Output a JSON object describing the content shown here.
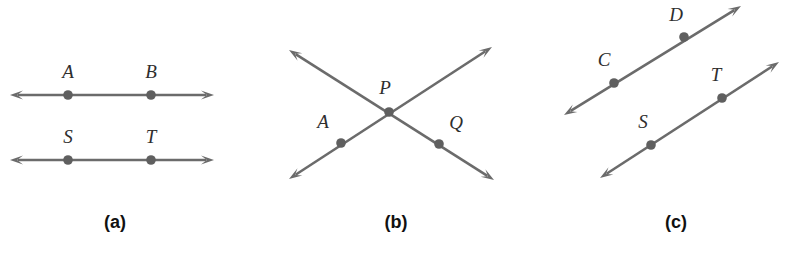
{
  "figure": {
    "width": 793,
    "height": 257,
    "background": "#ffffff",
    "line_color": "#6b6b6b",
    "dot_color": "#5f5f5f",
    "label_color": "#2e2e2e",
    "caption_color": "#111111"
  },
  "panels": [
    {
      "id": "panel-a",
      "caption": "(a)",
      "caption_x": 115,
      "caption_y": 228,
      "kind": "parallel-horizontal-lines",
      "lines": [
        {
          "name": "line-AB",
          "x1": 10,
          "y1": 95,
          "x2": 214,
          "y2": 95,
          "arrow_start": true,
          "arrow_end": true
        },
        {
          "name": "line-ST",
          "x1": 10,
          "y1": 160,
          "x2": 214,
          "y2": 160,
          "arrow_start": true,
          "arrow_end": true
        }
      ],
      "points": [
        {
          "name": "point-A",
          "label": "A",
          "x": 68,
          "y": 95,
          "label_x": 68,
          "label_y": 78
        },
        {
          "name": "point-B",
          "label": "B",
          "x": 151,
          "y": 95,
          "label_x": 151,
          "label_y": 78
        },
        {
          "name": "point-S",
          "label": "S",
          "x": 68,
          "y": 160,
          "label_x": 68,
          "label_y": 143
        },
        {
          "name": "point-T",
          "label": "T",
          "x": 151,
          "y": 160,
          "label_x": 151,
          "label_y": 143
        }
      ]
    },
    {
      "id": "panel-b",
      "caption": "(b)",
      "caption_x": 396,
      "caption_y": 228,
      "kind": "intersecting-lines",
      "lines": [
        {
          "name": "line-through-A",
          "x1": 289,
          "y1": 50,
          "x2": 494,
          "y2": 180,
          "arrow_start": true,
          "arrow_end": true
        },
        {
          "name": "line-through-Q",
          "x1": 289,
          "y1": 179,
          "x2": 492,
          "y2": 47,
          "arrow_start": true,
          "arrow_end": true
        }
      ],
      "points": [
        {
          "name": "point-P",
          "label": "P",
          "x": 389,
          "y": 112,
          "label_x": 385,
          "label_y": 94
        },
        {
          "name": "point-A",
          "label": "A",
          "x": 341,
          "y": 143,
          "label_x": 323,
          "label_y": 128
        },
        {
          "name": "point-Q",
          "label": "Q",
          "x": 439,
          "y": 144,
          "label_x": 456,
          "label_y": 129
        }
      ]
    },
    {
      "id": "panel-c",
      "caption": "(c)",
      "caption_x": 676,
      "caption_y": 228,
      "kind": "parallel-oblique-lines",
      "lines": [
        {
          "name": "line-CD",
          "x1": 564,
          "y1": 115,
          "x2": 741,
          "y2": 6,
          "arrow_start": true,
          "arrow_end": true
        },
        {
          "name": "line-ST",
          "x1": 600,
          "y1": 178,
          "x2": 779,
          "y2": 62,
          "arrow_start": true,
          "arrow_end": true
        }
      ],
      "points": [
        {
          "name": "point-C",
          "label": "C",
          "x": 614,
          "y": 83,
          "label_x": 604,
          "label_y": 66
        },
        {
          "name": "point-D",
          "label": "D",
          "x": 684,
          "y": 37,
          "label_x": 676,
          "label_y": 21
        },
        {
          "name": "point-S",
          "label": "S",
          "x": 651,
          "y": 145,
          "label_x": 643,
          "label_y": 128
        },
        {
          "name": "point-T",
          "label": "T",
          "x": 722,
          "y": 98,
          "label_x": 716,
          "label_y": 81
        }
      ]
    }
  ]
}
